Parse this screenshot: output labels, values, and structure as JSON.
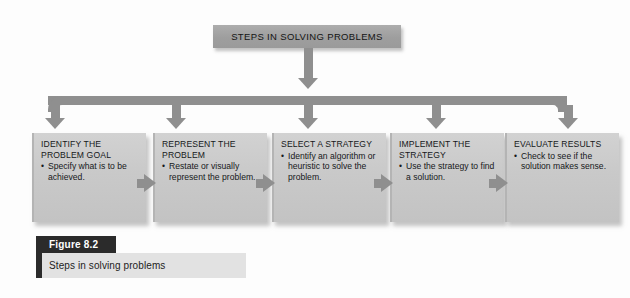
{
  "figure": {
    "header": {
      "label": "STEPS IN SOLVING PROBLEMS"
    },
    "steps": [
      {
        "title": "IDENTIFY THE PROBLEM GOAL",
        "bullet": "Specify what is to be achieved."
      },
      {
        "title": "REPRESENT THE PROBLEM",
        "bullet": "Restate or visually represent the problem."
      },
      {
        "title": "SELECT A STRATEGY",
        "bullet": "Identify an algorithm or heuristic to solve the problem."
      },
      {
        "title": "IMPLEMENT THE STRATEGY",
        "bullet": "Use the strategy to find a solution."
      },
      {
        "title": "EVALUATE RESULTS",
        "bullet": "Check to see if the solution makes sense."
      }
    ],
    "caption": {
      "number": "Figure 8.2",
      "title": "Steps in solving problems"
    },
    "colors": {
      "header_fill": "#9e9e9e",
      "box_fill": "#c9c9c9",
      "connector": "#8f8f8f",
      "caption_dark": "#2b2b2b",
      "caption_light": "#e2e2e2",
      "page_background": "#fdfdfd"
    }
  }
}
